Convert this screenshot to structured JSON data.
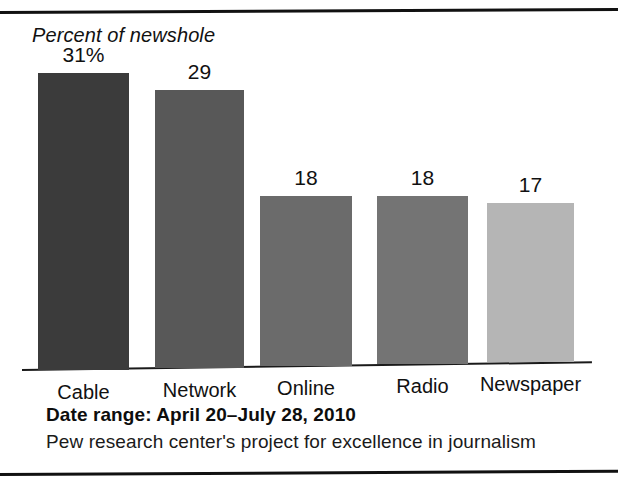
{
  "chart_data": {
    "type": "bar",
    "title": "",
    "ylabel": "Percent of newshole",
    "xlabel": "",
    "ylim": [
      0,
      33
    ],
    "grid": false,
    "legend": "none",
    "categories": [
      "Cable",
      "Network",
      "Online",
      "Radio",
      "Newspaper"
    ],
    "values": [
      31,
      29,
      18,
      18,
      17
    ],
    "value_labels": [
      "31%",
      "29",
      "18",
      "18",
      "17"
    ],
    "bar_colors": [
      "#3b3b3b",
      "#585858",
      "#6b6b6b",
      "#747474",
      "#b5b5b5"
    ],
    "annotations": {
      "date_range": "Date range: April 20–July 28, 2010",
      "source": "Pew research center's project for excellence in journalism"
    }
  },
  "figure": {
    "axis_title": "Percent of newshole",
    "footer": {
      "date_range": "Date range: April 20–July 28, 2010",
      "source": "Pew research center's project for excellence in journalism"
    }
  }
}
